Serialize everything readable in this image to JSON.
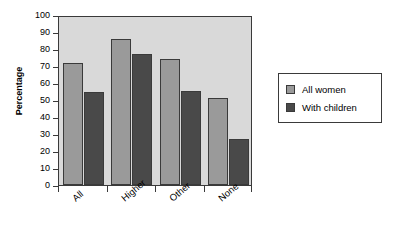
{
  "chart_data": {
    "type": "bar",
    "title": "",
    "subtitle": "",
    "xlabel": "",
    "ylabel": "Percentage",
    "categories": [
      "All",
      "Higher",
      "Other",
      "None"
    ],
    "series": [
      {
        "name": "All women",
        "color": "#9a9a9a",
        "values": [
          72,
          86,
          74,
          51
        ]
      },
      {
        "name": "With children",
        "color": "#494949",
        "values": [
          55,
          77,
          55.5,
          27
        ]
      }
    ],
    "ylim": [
      0,
      100
    ],
    "ytick_step": 10,
    "yticks": [
      0,
      10,
      20,
      30,
      40,
      50,
      60,
      70,
      80,
      90,
      100
    ],
    "ytick_labels": [
      "0",
      "10",
      "20",
      "30",
      "40",
      "50",
      "60",
      "70",
      "80",
      "90",
      "100"
    ],
    "grid": false,
    "legend_position": "right",
    "legend_entries": [
      "All women",
      "With children"
    ],
    "plot_background": "#d9d9d9",
    "axis_color": "#3a3a3a",
    "xtick_label_rotation": -40
  }
}
